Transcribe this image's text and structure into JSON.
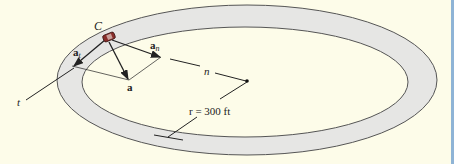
{
  "diagram": {
    "labels": {
      "car": "C",
      "a_t_main": "a",
      "a_t_sub": "t",
      "a_n_main": "a",
      "a_n_sub": "n",
      "a_total": "a",
      "normal_axis": "n",
      "tangent_axis": "t",
      "radius": "r = 300 ft"
    },
    "colors": {
      "background": "#fdfce9",
      "track_fill": "#e6e6e4",
      "track_edge": "#555555",
      "car": "#8a2e2a",
      "lines": "#222222",
      "border": "#8fb4d6"
    }
  }
}
